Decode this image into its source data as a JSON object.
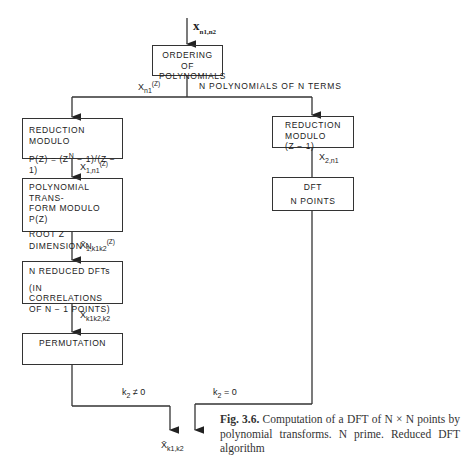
{
  "figure": {
    "input_label": "x",
    "input_sub": "n1,n2",
    "boxes": {
      "ordering": [
        "ORDERING OF",
        "POLYNOMIALS"
      ],
      "reduction_left": [
        "REDUCTION MODULO",
        "P(Z) = (Z",
        "N",
        " − 1)/(Z − 1)"
      ],
      "poly_transform": [
        "POLYNOMIAL TRANS-",
        "FORM MODULO P(Z)",
        "ROOT Z",
        "DIMENSION N"
      ],
      "reduced_dfts": [
        "N REDUCED DFTs",
        "(IN CORRELATIONS",
        "OF N − 1 POINTS)"
      ],
      "permutation": "PERMUTATION",
      "reduction_right": [
        "REDUCTION",
        "MODULO",
        "(Z − 1)"
      ],
      "dft": [
        "DFT",
        "N POINTS"
      ]
    },
    "edge_labels": {
      "xn1z": "X",
      "xn1z_sub": "n1",
      "xn1z_tail": "(Z)",
      "n_polys": "N POLYNOMIALS OF N TERMS",
      "x1n1": "X",
      "x1n1_sub": "1,n1",
      "x1n1_tail": "(Z)",
      "x1k": "X̄",
      "x1k_sub": "1,k1k2",
      "x1k_tail": "(Z)",
      "xkk": "X̄",
      "xkk_sub": "k1k2,k2",
      "x2n1": "X",
      "x2n1_sub": "2,n1",
      "k2_ne": "k",
      "k2_ne_sub": "2",
      "k2_ne_tail": " ≠ 0",
      "k2_eq": "k",
      "k2_eq_sub": "2",
      "k2_eq_tail": " = 0",
      "output": "X̄",
      "output_sub": "k1,k2"
    },
    "caption": {
      "label": "Fig. 3.6.",
      "text": " Computation of a DFT of N × N points by polynomial transforms. N prime. Reduced DFT algorithm"
    }
  }
}
